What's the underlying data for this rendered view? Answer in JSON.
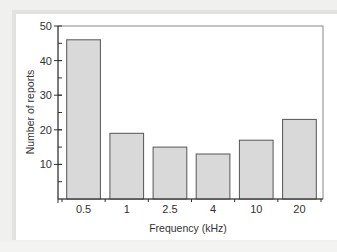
{
  "chart_data": {
    "type": "bar",
    "title": "",
    "xlabel": "Frequency (kHz)",
    "ylabel": "Number of reports",
    "categories": [
      "0.5",
      "1",
      "2.5",
      "4",
      "10",
      "20"
    ],
    "values": [
      46,
      19,
      15,
      13,
      17,
      23
    ],
    "ylim": [
      0,
      50
    ],
    "yticks": [
      10,
      20,
      30,
      40,
      50
    ],
    "minor_ytick_step": 5,
    "grid": false,
    "legend": null,
    "bar_color": "#d9d9d9",
    "bar_edge_color": "#555555"
  }
}
